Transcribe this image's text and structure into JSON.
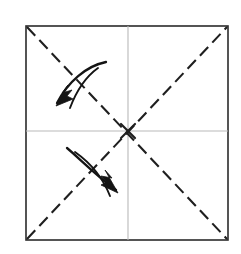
{
  "figure": {
    "background_color": "#ffffff"
  },
  "sheet": {
    "name": "paper-square",
    "x": 26,
    "y": 26,
    "width": 202,
    "height": 214,
    "edge_color": "#2b2b2b",
    "fill_color": "#ffffff",
    "edge_width": 1.6
  },
  "creases": {
    "dashed_color": "#1f1f1f",
    "dashed_width": 2.1,
    "dash_pattern": "12 6",
    "solid_color": "#b9b9b9",
    "solid_width": 1.1,
    "lines": [
      {
        "name": "crease-diagonal-tl-br",
        "style": "dashed",
        "x1": 27,
        "y1": 27,
        "x2": 227,
        "y2": 239
      },
      {
        "name": "crease-diagonal-bl-tr",
        "style": "dashed",
        "x1": 27,
        "y1": 239,
        "x2": 227,
        "y2": 27
      },
      {
        "name": "crease-horizontal-center",
        "style": "solid",
        "x1": 26,
        "y1": 131,
        "x2": 228,
        "y2": 131
      },
      {
        "name": "crease-vertical-center",
        "style": "solid",
        "x1": 128,
        "y1": 26,
        "x2": 128,
        "y2": 240
      }
    ]
  },
  "center_mark": {
    "name": "center-cross-mark",
    "cx": 128,
    "cy": 131,
    "arm": 7,
    "color": "#1f1f1f"
  },
  "arrows": [
    {
      "name": "fold-arrow-upper-left",
      "direction": "down-left",
      "color": "#141414",
      "tail": {
        "x": 106,
        "y": 62
      },
      "head": {
        "x": 56,
        "y": 106
      },
      "outer_path": "M106,62 C86,66 68,82 57,103",
      "inner_path": "M98,68 C84,78 76,92 70,108",
      "head_points": "56,106 73,99 67,96 72,90 62,93 68,85"
    },
    {
      "name": "fold-arrow-lower-right",
      "direction": "down-right",
      "color": "#141414",
      "tail": {
        "x": 67,
        "y": 148
      },
      "head": {
        "x": 118,
        "y": 193
      },
      "outer_path": "M67,148 C79,158 93,173 116,190",
      "inner_path": "M75,152 C92,164 103,178 110,196",
      "head_points": "118,193 101,185 107,182 101,176 112,178 105,170"
    }
  ]
}
